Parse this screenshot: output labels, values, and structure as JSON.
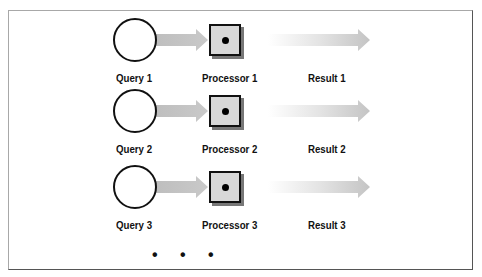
{
  "diagram": {
    "rows": [
      {
        "query": "Query 1",
        "processor": "Processor 1",
        "result": "Result 1"
      },
      {
        "query": "Query 2",
        "processor": "Processor 2",
        "result": "Result 2"
      },
      {
        "query": "Query 3",
        "processor": "Processor 3",
        "result": "Result 3"
      }
    ],
    "continuation": "• • •",
    "colors": {
      "arrow_fill": "#c8c8c8",
      "processor_fill": "#d8d8d8",
      "outline": "#111111"
    }
  }
}
